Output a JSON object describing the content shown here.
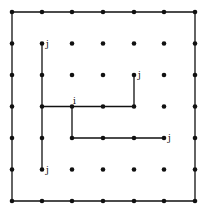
{
  "grid": {
    "cols": 7,
    "rows": 7,
    "x": [
      12,
      42,
      72,
      103,
      134,
      164,
      195
    ],
    "y": [
      12,
      43.5,
      75,
      106.5,
      138,
      169.5,
      201
    ],
    "dot_color": "#111111",
    "line_color": "#111111"
  },
  "paths": [
    {
      "name": "outer-square",
      "points": [
        [
          0,
          0
        ],
        [
          6,
          0
        ],
        [
          6,
          6
        ],
        [
          0,
          6
        ],
        [
          0,
          0
        ]
      ]
    },
    {
      "name": "inner-vertical-left",
      "points": [
        [
          1,
          1
        ],
        [
          1,
          5
        ]
      ]
    },
    {
      "name": "middle-horizontal-to-up",
      "points": [
        [
          1,
          3
        ],
        [
          4,
          3
        ],
        [
          4,
          2
        ]
      ]
    },
    {
      "name": "lower-branch",
      "points": [
        [
          2,
          3
        ],
        [
          2,
          4
        ],
        [
          5,
          4
        ]
      ]
    }
  ],
  "labels": [
    {
      "text": "j",
      "col": 1,
      "row": 1,
      "dx": 4,
      "dy": 3
    },
    {
      "text": "j",
      "col": 4,
      "row": 2,
      "dx": 4,
      "dy": 3
    },
    {
      "text": "i",
      "col": 2,
      "row": 3,
      "dx": 1,
      "dy": -3
    },
    {
      "text": "j",
      "col": 5,
      "row": 4,
      "dx": 4,
      "dy": 3
    },
    {
      "text": "j",
      "col": 1,
      "row": 5,
      "dx": 4,
      "dy": 3
    }
  ]
}
